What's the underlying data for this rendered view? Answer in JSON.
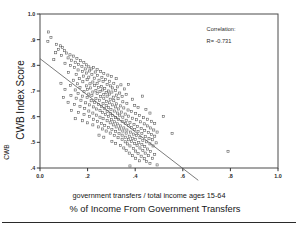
{
  "chart_data": {
    "type": "scatter",
    "title": "",
    "xlabel": "% of Income From Government Transfers",
    "xlabel_sub": "government transfers / total income ages 15-64",
    "ylabel": "CWB Index Score",
    "ylabel_outer": "CWB",
    "xlim": [
      0.0,
      1.0
    ],
    "ylim": [
      0.4,
      1.0
    ],
    "grid": false,
    "legend_position": "none",
    "xticks": [
      "0.0",
      ".2",
      ".4",
      ".6",
      ".8",
      "1.0"
    ],
    "xtick_values": [
      0.0,
      0.2,
      0.4,
      0.6,
      0.8,
      1.0
    ],
    "yticks": [
      "1.0",
      ".9",
      ".8",
      ".7",
      ".6",
      ".5",
      ".4"
    ],
    "ytick_values": [
      1.0,
      0.9,
      0.8,
      0.7,
      0.6,
      0.5,
      0.4
    ],
    "annotations": [
      {
        "name": "correlation-label",
        "text": "Correlation:",
        "x": 0.7,
        "y": 0.935
      },
      {
        "name": "correlation-value",
        "text": "R= -0.731",
        "x": 0.7,
        "y": 0.888
      }
    ],
    "correlation_r": -0.731,
    "marker_style": "open-square",
    "fit_line": {
      "name": "regression-line",
      "x_start": 0.0,
      "y_start": 0.826,
      "x_end": 0.665,
      "y_end": 0.352
    },
    "points": [
      [
        0.035,
        0.93
      ],
      [
        0.046,
        0.908
      ],
      [
        0.033,
        0.893
      ],
      [
        0.07,
        0.882
      ],
      [
        0.086,
        0.876
      ],
      [
        0.078,
        0.862
      ],
      [
        0.095,
        0.869
      ],
      [
        0.103,
        0.857
      ],
      [
        0.066,
        0.849
      ],
      [
        0.112,
        0.848
      ],
      [
        0.09,
        0.838
      ],
      [
        0.126,
        0.841
      ],
      [
        0.118,
        0.829
      ],
      [
        0.14,
        0.836
      ],
      [
        0.058,
        0.822
      ],
      [
        0.133,
        0.82
      ],
      [
        0.155,
        0.826
      ],
      [
        0.148,
        0.812
      ],
      [
        0.17,
        0.818
      ],
      [
        0.105,
        0.808
      ],
      [
        0.162,
        0.804
      ],
      [
        0.184,
        0.811
      ],
      [
        0.128,
        0.8
      ],
      [
        0.176,
        0.796
      ],
      [
        0.196,
        0.802
      ],
      [
        0.145,
        0.792
      ],
      [
        0.205,
        0.794
      ],
      [
        0.19,
        0.786
      ],
      [
        0.16,
        0.782
      ],
      [
        0.215,
        0.786
      ],
      [
        0.225,
        0.792
      ],
      [
        0.178,
        0.776
      ],
      [
        0.208,
        0.778
      ],
      [
        0.24,
        0.784
      ],
      [
        0.12,
        0.772
      ],
      [
        0.196,
        0.77
      ],
      [
        0.232,
        0.774
      ],
      [
        0.255,
        0.776
      ],
      [
        0.152,
        0.765
      ],
      [
        0.218,
        0.764
      ],
      [
        0.268,
        0.768
      ],
      [
        0.183,
        0.758
      ],
      [
        0.242,
        0.76
      ],
      [
        0.205,
        0.754
      ],
      [
        0.285,
        0.762
      ],
      [
        0.165,
        0.748
      ],
      [
        0.228,
        0.75
      ],
      [
        0.26,
        0.752
      ],
      [
        0.3,
        0.756
      ],
      [
        0.14,
        0.742
      ],
      [
        0.198,
        0.744
      ],
      [
        0.248,
        0.742
      ],
      [
        0.275,
        0.745
      ],
      [
        0.32,
        0.748
      ],
      [
        0.18,
        0.736
      ],
      [
        0.222,
        0.735
      ],
      [
        0.265,
        0.737
      ],
      [
        0.292,
        0.738
      ],
      [
        0.088,
        0.73
      ],
      [
        0.158,
        0.728
      ],
      [
        0.21,
        0.728
      ],
      [
        0.24,
        0.73
      ],
      [
        0.282,
        0.726
      ],
      [
        0.31,
        0.73
      ],
      [
        0.34,
        0.724
      ],
      [
        0.128,
        0.722
      ],
      [
        0.195,
        0.72
      ],
      [
        0.23,
        0.722
      ],
      [
        0.258,
        0.718
      ],
      [
        0.296,
        0.72
      ],
      [
        0.325,
        0.716
      ],
      [
        0.168,
        0.714
      ],
      [
        0.212,
        0.712
      ],
      [
        0.245,
        0.714
      ],
      [
        0.272,
        0.71
      ],
      [
        0.305,
        0.712
      ],
      [
        0.355,
        0.708
      ],
      [
        0.105,
        0.706
      ],
      [
        0.148,
        0.704
      ],
      [
        0.2,
        0.706
      ],
      [
        0.235,
        0.702
      ],
      [
        0.262,
        0.704
      ],
      [
        0.288,
        0.7
      ],
      [
        0.318,
        0.702
      ],
      [
        0.372,
        0.726
      ],
      [
        0.185,
        0.698
      ],
      [
        0.222,
        0.696
      ],
      [
        0.252,
        0.698
      ],
      [
        0.278,
        0.694
      ],
      [
        0.302,
        0.696
      ],
      [
        0.335,
        0.692
      ],
      [
        0.16,
        0.69
      ],
      [
        0.205,
        0.688
      ],
      [
        0.24,
        0.69
      ],
      [
        0.268,
        0.686
      ],
      [
        0.292,
        0.688
      ],
      [
        0.322,
        0.684
      ],
      [
        0.362,
        0.686
      ],
      [
        0.13,
        0.682
      ],
      [
        0.178,
        0.68
      ],
      [
        0.218,
        0.682
      ],
      [
        0.255,
        0.678
      ],
      [
        0.282,
        0.68
      ],
      [
        0.308,
        0.676
      ],
      [
        0.345,
        0.678
      ],
      [
        0.098,
        0.674
      ],
      [
        0.152,
        0.672
      ],
      [
        0.198,
        0.674
      ],
      [
        0.235,
        0.67
      ],
      [
        0.268,
        0.672
      ],
      [
        0.295,
        0.668
      ],
      [
        0.328,
        0.67
      ],
      [
        0.388,
        0.668
      ],
      [
        0.172,
        0.664
      ],
      [
        0.215,
        0.662
      ],
      [
        0.25,
        0.664
      ],
      [
        0.28,
        0.66
      ],
      [
        0.31,
        0.662
      ],
      [
        0.348,
        0.658
      ],
      [
        0.43,
        0.68
      ],
      [
        0.118,
        0.656
      ],
      [
        0.192,
        0.654
      ],
      [
        0.23,
        0.656
      ],
      [
        0.265,
        0.652
      ],
      [
        0.292,
        0.654
      ],
      [
        0.322,
        0.65
      ],
      [
        0.365,
        0.652
      ],
      [
        0.145,
        0.648
      ],
      [
        0.208,
        0.646
      ],
      [
        0.245,
        0.648
      ],
      [
        0.278,
        0.644
      ],
      [
        0.305,
        0.646
      ],
      [
        0.338,
        0.642
      ],
      [
        0.398,
        0.644
      ],
      [
        0.168,
        0.64
      ],
      [
        0.225,
        0.638
      ],
      [
        0.258,
        0.64
      ],
      [
        0.288,
        0.636
      ],
      [
        0.318,
        0.638
      ],
      [
        0.352,
        0.634
      ],
      [
        0.412,
        0.636
      ],
      [
        0.188,
        0.632
      ],
      [
        0.238,
        0.63
      ],
      [
        0.27,
        0.632
      ],
      [
        0.298,
        0.628
      ],
      [
        0.33,
        0.63
      ],
      [
        0.37,
        0.626
      ],
      [
        0.445,
        0.628
      ],
      [
        0.132,
        0.624
      ],
      [
        0.205,
        0.622
      ],
      [
        0.252,
        0.624
      ],
      [
        0.282,
        0.62
      ],
      [
        0.312,
        0.622
      ],
      [
        0.342,
        0.618
      ],
      [
        0.385,
        0.62
      ],
      [
        0.162,
        0.616
      ],
      [
        0.222,
        0.614
      ],
      [
        0.262,
        0.616
      ],
      [
        0.295,
        0.612
      ],
      [
        0.325,
        0.614
      ],
      [
        0.358,
        0.61
      ],
      [
        0.402,
        0.612
      ],
      [
        0.462,
        0.614
      ],
      [
        0.185,
        0.608
      ],
      [
        0.238,
        0.606
      ],
      [
        0.275,
        0.608
      ],
      [
        0.305,
        0.604
      ],
      [
        0.335,
        0.606
      ],
      [
        0.372,
        0.602
      ],
      [
        0.418,
        0.604
      ],
      [
        0.208,
        0.6
      ],
      [
        0.252,
        0.598
      ],
      [
        0.288,
        0.6
      ],
      [
        0.318,
        0.596
      ],
      [
        0.348,
        0.598
      ],
      [
        0.388,
        0.594
      ],
      [
        0.435,
        0.596
      ],
      [
        0.518,
        0.6
      ],
      [
        0.148,
        0.592
      ],
      [
        0.225,
        0.59
      ],
      [
        0.265,
        0.592
      ],
      [
        0.3,
        0.588
      ],
      [
        0.33,
        0.59
      ],
      [
        0.362,
        0.586
      ],
      [
        0.405,
        0.588
      ],
      [
        0.452,
        0.59
      ],
      [
        0.178,
        0.584
      ],
      [
        0.242,
        0.582
      ],
      [
        0.282,
        0.584
      ],
      [
        0.312,
        0.58
      ],
      [
        0.345,
        0.582
      ],
      [
        0.378,
        0.578
      ],
      [
        0.422,
        0.58
      ],
      [
        0.468,
        0.582
      ],
      [
        0.2,
        0.576
      ],
      [
        0.258,
        0.574
      ],
      [
        0.295,
        0.576
      ],
      [
        0.325,
        0.572
      ],
      [
        0.358,
        0.574
      ],
      [
        0.395,
        0.57
      ],
      [
        0.438,
        0.572
      ],
      [
        0.482,
        0.574
      ],
      [
        0.222,
        0.568
      ],
      [
        0.272,
        0.566
      ],
      [
        0.308,
        0.568
      ],
      [
        0.338,
        0.564
      ],
      [
        0.372,
        0.566
      ],
      [
        0.41,
        0.562
      ],
      [
        0.452,
        0.564
      ],
      [
        0.245,
        0.56
      ],
      [
        0.288,
        0.558
      ],
      [
        0.32,
        0.56
      ],
      [
        0.352,
        0.556
      ],
      [
        0.385,
        0.558
      ],
      [
        0.425,
        0.554
      ],
      [
        0.465,
        0.556
      ],
      [
        0.262,
        0.552
      ],
      [
        0.302,
        0.55
      ],
      [
        0.335,
        0.552
      ],
      [
        0.365,
        0.548
      ],
      [
        0.398,
        0.55
      ],
      [
        0.44,
        0.546
      ],
      [
        0.478,
        0.548
      ],
      [
        0.555,
        0.534
      ],
      [
        0.278,
        0.544
      ],
      [
        0.318,
        0.542
      ],
      [
        0.348,
        0.544
      ],
      [
        0.38,
        0.54
      ],
      [
        0.412,
        0.542
      ],
      [
        0.455,
        0.538
      ],
      [
        0.492,
        0.54
      ],
      [
        0.295,
        0.536
      ],
      [
        0.332,
        0.534
      ],
      [
        0.362,
        0.536
      ],
      [
        0.392,
        0.532
      ],
      [
        0.428,
        0.534
      ],
      [
        0.468,
        0.53
      ],
      [
        0.248,
        0.528
      ],
      [
        0.312,
        0.526
      ],
      [
        0.345,
        0.528
      ],
      [
        0.375,
        0.524
      ],
      [
        0.405,
        0.526
      ],
      [
        0.442,
        0.522
      ],
      [
        0.482,
        0.524
      ],
      [
        0.268,
        0.52
      ],
      [
        0.328,
        0.518
      ],
      [
        0.358,
        0.52
      ],
      [
        0.388,
        0.516
      ],
      [
        0.42,
        0.518
      ],
      [
        0.458,
        0.514
      ],
      [
        0.345,
        0.512
      ],
      [
        0.372,
        0.51
      ],
      [
        0.4,
        0.512
      ],
      [
        0.432,
        0.508
      ],
      [
        0.472,
        0.51
      ],
      [
        0.302,
        0.504
      ],
      [
        0.358,
        0.502
      ],
      [
        0.385,
        0.504
      ],
      [
        0.415,
        0.5
      ],
      [
        0.448,
        0.502
      ],
      [
        0.488,
        0.498
      ],
      [
        0.318,
        0.496
      ],
      [
        0.368,
        0.494
      ],
      [
        0.398,
        0.496
      ],
      [
        0.428,
        0.492
      ],
      [
        0.462,
        0.494
      ],
      [
        0.338,
        0.488
      ],
      [
        0.378,
        0.486
      ],
      [
        0.408,
        0.488
      ],
      [
        0.44,
        0.484
      ],
      [
        0.475,
        0.486
      ],
      [
        0.79,
        0.465
      ],
      [
        0.352,
        0.478
      ],
      [
        0.392,
        0.476
      ],
      [
        0.42,
        0.478
      ],
      [
        0.452,
        0.474
      ],
      [
        0.362,
        0.468
      ],
      [
        0.402,
        0.466
      ],
      [
        0.432,
        0.468
      ],
      [
        0.465,
        0.464
      ],
      [
        0.375,
        0.458
      ],
      [
        0.412,
        0.456
      ],
      [
        0.442,
        0.458
      ],
      [
        0.482,
        0.452
      ],
      [
        0.388,
        0.448
      ],
      [
        0.425,
        0.446
      ],
      [
        0.455,
        0.448
      ],
      [
        0.402,
        0.438
      ],
      [
        0.438,
        0.436
      ],
      [
        0.472,
        0.438
      ],
      [
        0.418,
        0.428
      ],
      [
        0.448,
        0.426
      ],
      [
        0.462,
        0.418
      ],
      [
        0.378,
        0.408
      ],
      [
        0.492,
        0.412
      ]
    ]
  },
  "footer": {
    "rule_visible": true
  }
}
